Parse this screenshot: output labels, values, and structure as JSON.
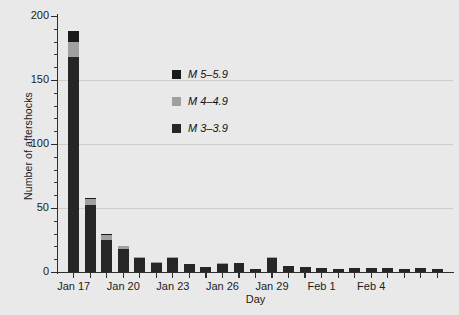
{
  "chart_data": {
    "type": "bar",
    "stacked": true,
    "title": "",
    "xlabel": "Day",
    "ylabel": "Number of aftershocks",
    "ylim": [
      0,
      200
    ],
    "ytick_labels": [
      "0",
      "50",
      "100",
      "150",
      "200"
    ],
    "ytick_values": [
      0,
      50,
      100,
      150,
      200
    ],
    "yminor_step": 10,
    "grid": "horizontal at 50, 100, 150",
    "legend_position": "inside-center-upper",
    "categories": [
      "Jan 17",
      "Jan 18",
      "Jan 19",
      "Jan 20",
      "Jan 21",
      "Jan 22",
      "Jan 23",
      "Jan 24",
      "Jan 25",
      "Jan 26",
      "Jan 27",
      "Jan 28",
      "Jan 29",
      "Jan 30",
      "Jan 31",
      "Feb 1",
      "Feb 2",
      "Feb 3",
      "Feb 4",
      "Feb 5",
      "Feb 6",
      "Feb 7",
      "Feb 8"
    ],
    "xtick_labels": [
      "Jan 17",
      "Jan 20",
      "Jan 23",
      "Jan 26",
      "Jan 29",
      "Feb 1",
      "Feb 4"
    ],
    "xtick_indices": [
      0,
      3,
      6,
      9,
      12,
      15,
      18
    ],
    "series": [
      {
        "name": "M 3-3.9",
        "legend_label": "M 3–3.9",
        "color": "#262626",
        "values": [
          168,
          52,
          25,
          18,
          11,
          7,
          11,
          6,
          4,
          6,
          7,
          2,
          11,
          5,
          4,
          3,
          2,
          3,
          3,
          3,
          2,
          3,
          2
        ]
      },
      {
        "name": "M 4-4.9",
        "legend_label": "M 4–4.9",
        "color": "#a0a0a0",
        "values": [
          12,
          5,
          4,
          2,
          1,
          1,
          1,
          0,
          0,
          1,
          0,
          0,
          1,
          0,
          0,
          0,
          0,
          0,
          0,
          0,
          0,
          0,
          0
        ]
      },
      {
        "name": "M 5-5.9",
        "legend_label": "M 5–5.9",
        "color": "#1a1a1a",
        "values": [
          8,
          1,
          1,
          0,
          0,
          0,
          0,
          0,
          0,
          0,
          0,
          0,
          0,
          0,
          0,
          0,
          0,
          0,
          0,
          0,
          0,
          0,
          0
        ]
      }
    ],
    "totals": [
      188,
      58,
      30,
      20,
      12,
      8,
      12,
      6,
      4,
      7,
      7,
      2,
      12,
      5,
      4,
      3,
      2,
      3,
      3,
      3,
      2,
      3,
      2
    ]
  },
  "legend": {
    "entries": [
      {
        "label": "M 5–5.9",
        "color": "#1a1a1a"
      },
      {
        "label": "M 4–4.9",
        "color": "#a0a0a0"
      },
      {
        "label": "M 3–3.9",
        "color": "#262626"
      }
    ]
  },
  "axes": {
    "x_title": "Day",
    "y_title": "Number of aftershocks"
  },
  "colors": {
    "background": "#e9e9e9",
    "axis": "#2e2e2e",
    "grid": "#cdcdcd",
    "text": "#1c1c1c"
  }
}
